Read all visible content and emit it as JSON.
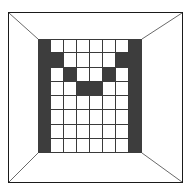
{
  "canvas": {
    "width": 192,
    "height": 191,
    "background": "#ffffff"
  },
  "frame": {
    "label": "perspective-room-frame",
    "border_color": "#1a1a1a",
    "fill_color": "#ffffff",
    "x": 8,
    "y": 12,
    "width": 175,
    "height": 171
  },
  "perspective_lines": {
    "label": "corner-vanishing-lines",
    "color": "#6a6a6a",
    "count": 4,
    "segments": [
      {
        "name": "top-left-diagonal",
        "x1": 9,
        "y1": 13,
        "x2": 38,
        "y2": 39
      },
      {
        "name": "top-right-diagonal",
        "x1": 182,
        "y1": 13,
        "x2": 142,
        "y2": 39
      },
      {
        "name": "bottom-left-diagonal",
        "x1": 9,
        "y1": 182,
        "x2": 38,
        "y2": 153
      },
      {
        "name": "bottom-right-diagonal",
        "x1": 182,
        "y1": 182,
        "x2": 142,
        "y2": 153
      }
    ]
  },
  "grid": {
    "label": "pixel-face-grid",
    "rows": 8,
    "cols": 8,
    "cell_width": 13,
    "cell_height": 14.25,
    "x": 38,
    "y": 39,
    "width": 104,
    "height": 114,
    "dark_color": "#3d3d3d",
    "light_color": "#ffffff",
    "line_color": "#3a3a3a",
    "legend": {
      "1": "dark",
      "0": "light"
    },
    "pattern": [
      [
        1,
        0,
        0,
        0,
        0,
        0,
        0,
        1
      ],
      [
        1,
        1,
        0,
        0,
        0,
        0,
        1,
        1
      ],
      [
        1,
        0,
        1,
        0,
        0,
        1,
        0,
        1
      ],
      [
        1,
        0,
        0,
        1,
        1,
        0,
        0,
        1
      ],
      [
        1,
        0,
        0,
        0,
        0,
        0,
        0,
        1
      ],
      [
        1,
        0,
        0,
        0,
        0,
        0,
        0,
        1
      ],
      [
        1,
        0,
        0,
        0,
        0,
        0,
        0,
        1
      ],
      [
        1,
        0,
        0,
        0,
        0,
        0,
        0,
        1
      ]
    ]
  }
}
